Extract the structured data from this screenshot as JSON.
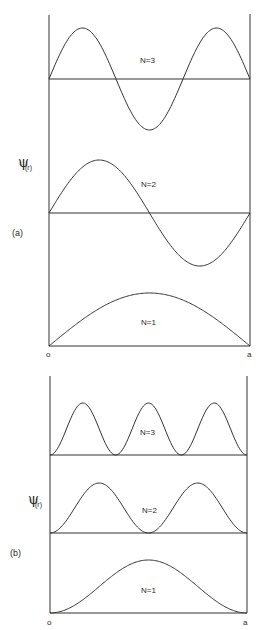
{
  "figure": {
    "y_axis_label": "ψ",
    "y_axis_subscript": "(r)",
    "x_start_label": "o",
    "x_end_label": "a",
    "line_color": "#333333",
    "background": "#ffffff"
  },
  "panel_a": {
    "tag": "(a)",
    "description": "Wavefunction ψ(r) of particle in a box",
    "curves": [
      {
        "label": "N=3"
      },
      {
        "label": "N=2"
      },
      {
        "label": "N=1"
      }
    ]
  },
  "panel_b": {
    "tag": "(b)",
    "description": "Probability density |ψ(r)|² of particle in a box",
    "curves": [
      {
        "label": "N=3"
      },
      {
        "label": "N=2"
      },
      {
        "label": "N=1"
      }
    ]
  }
}
